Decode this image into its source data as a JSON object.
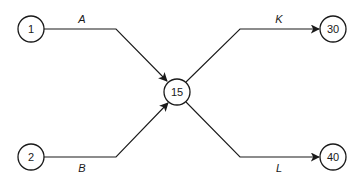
{
  "diagram": {
    "type": "activity-network",
    "nodes": [
      {
        "id": "1",
        "label": "1",
        "x": 31,
        "y": 29
      },
      {
        "id": "2",
        "label": "2",
        "x": 31,
        "y": 157
      },
      {
        "id": "15",
        "label": "15",
        "x": 177,
        "y": 92
      },
      {
        "id": "30",
        "label": "30",
        "x": 333,
        "y": 29
      },
      {
        "id": "40",
        "label": "40",
        "x": 333,
        "y": 157
      }
    ],
    "edges": [
      {
        "from": "1",
        "to": "15",
        "label": "A"
      },
      {
        "from": "2",
        "to": "15",
        "label": "B"
      },
      {
        "from": "15",
        "to": "30",
        "label": "K"
      },
      {
        "from": "15",
        "to": "40",
        "label": "L"
      }
    ]
  }
}
